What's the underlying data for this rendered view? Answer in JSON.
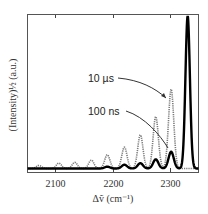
{
  "chart_data": {
    "type": "line",
    "title": "",
    "xlabel": "Δṽ (cm⁻¹)",
    "ylabel": "(Intensity)½ (a.u.)",
    "xlim": [
      2050,
      2350
    ],
    "ylim": [
      0,
      1
    ],
    "xticks": [
      2100,
      2200,
      2300
    ],
    "xtick_labels": [
      "2100",
      "2200",
      "2300"
    ],
    "yticks": [],
    "grid": false,
    "legend": "none (inline annotations with arrows)",
    "annotations": [
      {
        "text": "10 µs",
        "points_to": "dotted series peak near 2300"
      },
      {
        "text": "100 ns",
        "points_to": "solid series peak near 2300"
      }
    ],
    "series": [
      {
        "name": "10 µs",
        "style": "dotted",
        "color": "#808080",
        "peaks": [
          {
            "x": 2070,
            "y": 0.02
          },
          {
            "x": 2105,
            "y": 0.035
          },
          {
            "x": 2133,
            "y": 0.04
          },
          {
            "x": 2162,
            "y": 0.055
          },
          {
            "x": 2190,
            "y": 0.09
          },
          {
            "x": 2220,
            "y": 0.14
          },
          {
            "x": 2248,
            "y": 0.22
          },
          {
            "x": 2275,
            "y": 0.34
          },
          {
            "x": 2302,
            "y": 0.52
          }
        ]
      },
      {
        "name": "100 ns",
        "style": "solid",
        "color": "#000000",
        "peaks": [
          {
            "x": 2190,
            "y": 0.012
          },
          {
            "x": 2220,
            "y": 0.025
          },
          {
            "x": 2248,
            "y": 0.035
          },
          {
            "x": 2275,
            "y": 0.06
          },
          {
            "x": 2302,
            "y": 0.11
          },
          {
            "x": 2331,
            "y": 1.0
          }
        ]
      }
    ]
  },
  "labels": {
    "tick_2100": "2100",
    "tick_2200": "2200",
    "tick_2300": "2300",
    "xlabel": "Δṽ (cm⁻¹)",
    "ylabel": "(Intensity)½ (a.u.)",
    "anno_10us": "10 µs",
    "anno_100ns": "100 ns"
  }
}
